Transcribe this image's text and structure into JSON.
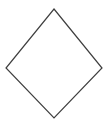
{
  "figure": {
    "title": "",
    "background_color": "#ffffff",
    "canvas": {
      "width": 108,
      "height": 126
    },
    "shape": {
      "name": "rhombus",
      "alt_names": "diamond",
      "sides": 4,
      "vertices_count": 4,
      "stroke_color": "#3f3f3f",
      "stroke_width": 1.2,
      "fill_color": "none",
      "closed": true,
      "vertices": [
        {
          "label": "top",
          "x": 54,
          "y": 9
        },
        {
          "label": "right",
          "x": 102,
          "y": 68
        },
        {
          "label": "bottom",
          "x": 54,
          "y": 118
        },
        {
          "label": "left",
          "x": 6,
          "y": 68
        }
      ],
      "points_attr": "54,9 102,68 54,118 6,68",
      "bounding_box": {
        "x": 6,
        "y": 9,
        "width": 96,
        "height": 109
      },
      "diagonals": {
        "horizontal": 96,
        "vertical": 109
      }
    }
  }
}
